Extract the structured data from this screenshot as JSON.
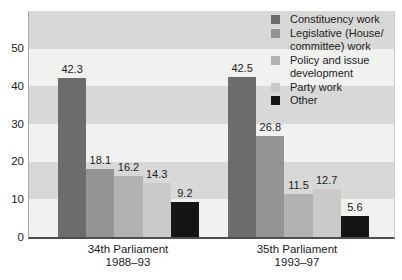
{
  "chart_data": {
    "type": "bar",
    "title": "",
    "categories": [
      "34th Parliament 1988–93",
      "35th Parliament 1993–97"
    ],
    "groups": [
      {
        "label": [
          "34th Parliament",
          "1988–93"
        ],
        "values": [
          42.3,
          18.1,
          16.2,
          14.3,
          9.2
        ]
      },
      {
        "label": [
          "35th Parliament",
          "1993–97"
        ],
        "values": [
          42.5,
          26.8,
          11.5,
          12.7,
          5.6
        ]
      }
    ],
    "series": [
      {
        "name": "Constituency work",
        "color": "#6c6c6e",
        "values": [
          42.3,
          42.5
        ],
        "legend_lines": [
          "Constituency work"
        ]
      },
      {
        "name": "Legislative (House/committee) work",
        "color": "#949496",
        "values": [
          18.1,
          26.8
        ],
        "legend_lines": [
          "Legislative (House/",
          "committee) work"
        ]
      },
      {
        "name": "Policy and issue development",
        "color": "#b2b2b4",
        "values": [
          16.2,
          11.5
        ],
        "legend_lines": [
          "Policy and issue",
          "development"
        ]
      },
      {
        "name": "Party work",
        "color": "#cccac8",
        "values": [
          14.3,
          12.7
        ],
        "legend_lines": [
          "Party work"
        ]
      },
      {
        "name": "Other",
        "color": "#151515",
        "values": [
          9.2,
          5.6
        ],
        "legend_lines": [
          "Other"
        ]
      }
    ],
    "xlabel": "",
    "ylabel": "",
    "yticks": [
      0,
      10,
      20,
      30,
      40,
      50
    ],
    "ylim": [
      0,
      60
    ],
    "grid": "alternating horizontal bands every 10 units",
    "band_colors": {
      "light": "#f1f1ef",
      "dark": "#d8d8d6"
    },
    "legend_position": "top-right inside plot area",
    "text_color": "#1c1c1c"
  }
}
